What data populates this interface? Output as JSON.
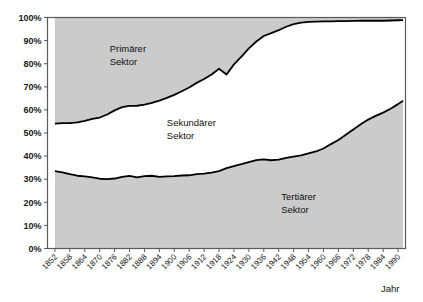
{
  "chart_data": {
    "type": "area",
    "title": "",
    "xlabel": "Jahr",
    "ylabel": "",
    "ylim": [
      0,
      100
    ],
    "xlim": [
      1849,
      1993
    ],
    "grid": false,
    "legend_position": "inline-annotations",
    "stacked": true,
    "y_ticks": [
      "0%",
      "10%",
      "20%",
      "30%",
      "40%",
      "50%",
      "60%",
      "70%",
      "80%",
      "90%",
      "100%"
    ],
    "y_tick_values": [
      0,
      10,
      20,
      30,
      40,
      50,
      60,
      70,
      80,
      90,
      100
    ],
    "x_ticks": [
      "1852",
      "1858",
      "1864",
      "1870",
      "1876",
      "1882",
      "1888",
      "1894",
      "1900",
      "1906",
      "1912",
      "1918",
      "1924",
      "1930",
      "1936",
      "1942",
      "1948",
      "1954",
      "1960",
      "1966",
      "1972",
      "1978",
      "1984",
      "1990"
    ],
    "x_tick_values": [
      1852,
      1858,
      1864,
      1870,
      1876,
      1882,
      1888,
      1894,
      1900,
      1906,
      1912,
      1918,
      1924,
      1930,
      1936,
      1942,
      1948,
      1954,
      1960,
      1966,
      1972,
      1978,
      1984,
      1990
    ],
    "annotations": [
      {
        "text": "Primärer",
        "text2": "Sektor",
        "x": 1874,
        "y": 85
      },
      {
        "text": "Sekundärer",
        "text2": "Sektor",
        "x": 1897,
        "y": 53
      },
      {
        "text": "Tertiärer",
        "text2": "Sektor",
        "x": 1943,
        "y": 21
      }
    ],
    "x": [
      1852,
      1855,
      1858,
      1861,
      1864,
      1867,
      1870,
      1873,
      1876,
      1879,
      1882,
      1885,
      1888,
      1891,
      1894,
      1897,
      1900,
      1903,
      1906,
      1909,
      1912,
      1915,
      1918,
      1921,
      1924,
      1927,
      1930,
      1933,
      1936,
      1939,
      1942,
      1945,
      1948,
      1951,
      1954,
      1957,
      1960,
      1963,
      1966,
      1969,
      1972,
      1975,
      1978,
      1981,
      1984,
      1987,
      1990,
      1992
    ],
    "series": [
      {
        "name": "Tertiärer Sektor",
        "values": [
          33.5,
          33.0,
          32.2,
          31.5,
          31.2,
          30.8,
          30.2,
          30.0,
          30.3,
          31.0,
          31.4,
          30.8,
          31.3,
          31.5,
          31.0,
          31.2,
          31.3,
          31.6,
          31.7,
          32.2,
          32.4,
          32.8,
          33.5,
          34.8,
          35.7,
          36.5,
          37.4,
          38.3,
          38.6,
          38.2,
          38.5,
          39.2,
          39.8,
          40.3,
          41.2,
          42.0,
          43.3,
          45.2,
          47.0,
          49.2,
          51.5,
          53.8,
          55.8,
          57.4,
          58.8,
          60.5,
          62.5,
          64.0
        ]
      },
      {
        "name": "Sekundärer Sektor",
        "values": [
          20.6,
          21.3,
          22.1,
          23.1,
          24.0,
          25.3,
          26.5,
          28.0,
          29.5,
          30.2,
          30.3,
          31.0,
          31.0,
          31.5,
          33.0,
          34.0,
          35.2,
          36.5,
          38.0,
          39.5,
          41.0,
          42.5,
          44.3,
          40.5,
          44.0,
          46.6,
          49.2,
          51.3,
          53.4,
          55.0,
          56.0,
          56.8,
          57.3,
          57.5,
          56.9,
          56.2,
          55.0,
          53.1,
          51.4,
          49.2,
          47.0,
          44.8,
          42.8,
          41.2,
          39.8,
          38.2,
          36.3,
          34.9
        ]
      },
      {
        "name": "Primärer Sektor",
        "values": [
          45.9,
          45.7,
          45.7,
          45.4,
          44.8,
          43.9,
          43.3,
          42.0,
          40.2,
          38.8,
          38.3,
          38.2,
          37.7,
          37.0,
          36.0,
          34.8,
          33.5,
          31.9,
          30.3,
          28.3,
          26.6,
          24.7,
          22.2,
          24.7,
          20.3,
          16.9,
          13.4,
          10.4,
          8.0,
          6.8,
          5.5,
          4.0,
          2.9,
          2.2,
          1.9,
          1.8,
          1.7,
          1.7,
          1.6,
          1.6,
          1.5,
          1.4,
          1.4,
          1.4,
          1.4,
          1.3,
          1.2,
          1.1
        ]
      }
    ],
    "colors": {
      "primary_fill": "#cbcbcb",
      "secondary_fill": "#ffffff",
      "tertiary_fill": "#cbcbcb",
      "line": "#000000",
      "frame": "#5a5a5a",
      "text": "#111111"
    }
  }
}
